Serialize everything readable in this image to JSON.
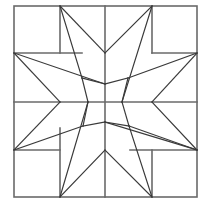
{
  "diagram": {
    "title": "",
    "colors": {
      "background": "#ffffff",
      "stroke": "#3a3a3a",
      "grid_stroke": "#6a6a6a"
    },
    "frame": {
      "x": 14,
      "y": 6,
      "width": 183,
      "height": 191
    },
    "grid_lines": [
      {
        "x1": 105,
        "y1": 6,
        "x2": 105,
        "y2": 197
      },
      {
        "x1": 14,
        "y1": 102,
        "x2": 197,
        "y2": 102
      },
      {
        "x1": 60,
        "y1": 6,
        "x2": 60,
        "y2": 53
      },
      {
        "x1": 14,
        "y1": 53,
        "x2": 82,
        "y2": 53
      },
      {
        "x1": 152,
        "y1": 6,
        "x2": 152,
        "y2": 53
      },
      {
        "x1": 152,
        "y1": 53,
        "x2": 197,
        "y2": 53
      },
      {
        "x1": 14,
        "y1": 150,
        "x2": 60,
        "y2": 150
      },
      {
        "x1": 60,
        "y1": 128,
        "x2": 60,
        "y2": 197
      },
      {
        "x1": 152,
        "y1": 150,
        "x2": 152,
        "y2": 197
      },
      {
        "x1": 130,
        "y1": 150,
        "x2": 197,
        "y2": 150
      }
    ],
    "star_lines": [
      {
        "x1": 60,
        "y1": 6,
        "x2": 82,
        "y2": 78
      },
      {
        "x1": 60,
        "y1": 6,
        "x2": 105,
        "y2": 53
      },
      {
        "x1": 152,
        "y1": 6,
        "x2": 105,
        "y2": 53
      },
      {
        "x1": 152,
        "y1": 6,
        "x2": 122,
        "y2": 102
      },
      {
        "x1": 197,
        "y1": 53,
        "x2": 128,
        "y2": 78
      },
      {
        "x1": 197,
        "y1": 53,
        "x2": 152,
        "y2": 102
      },
      {
        "x1": 197,
        "y1": 150,
        "x2": 152,
        "y2": 102
      },
      {
        "x1": 197,
        "y1": 150,
        "x2": 129,
        "y2": 126
      },
      {
        "x1": 152,
        "y1": 197,
        "x2": 129,
        "y2": 126
      },
      {
        "x1": 152,
        "y1": 197,
        "x2": 105,
        "y2": 150
      },
      {
        "x1": 60,
        "y1": 197,
        "x2": 105,
        "y2": 150
      },
      {
        "x1": 60,
        "y1": 197,
        "x2": 88,
        "y2": 102
      },
      {
        "x1": 14,
        "y1": 150,
        "x2": 83,
        "y2": 126
      },
      {
        "x1": 14,
        "y1": 150,
        "x2": 60,
        "y2": 102
      },
      {
        "x1": 14,
        "y1": 53,
        "x2": 60,
        "y2": 102
      },
      {
        "x1": 14,
        "y1": 53,
        "x2": 105,
        "y2": 84
      },
      {
        "x1": 105,
        "y1": 84,
        "x2": 82,
        "y2": 78
      },
      {
        "x1": 82,
        "y1": 78,
        "x2": 88,
        "y2": 102
      },
      {
        "x1": 128,
        "y1": 78,
        "x2": 105,
        "y2": 84
      },
      {
        "x1": 122,
        "y1": 102,
        "x2": 128,
        "y2": 78
      },
      {
        "x1": 105,
        "y1": 122,
        "x2": 129,
        "y2": 126
      },
      {
        "x1": 129,
        "y1": 126,
        "x2": 122,
        "y2": 102
      },
      {
        "x1": 83,
        "y1": 126,
        "x2": 105,
        "y2": 122
      },
      {
        "x1": 83,
        "y1": 126,
        "x2": 88,
        "y2": 102
      },
      {
        "x1": 105,
        "y1": 122,
        "x2": 197,
        "y2": 150
      }
    ]
  }
}
